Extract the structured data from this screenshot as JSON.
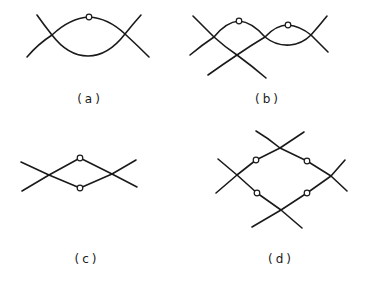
{
  "figure": {
    "stroke_color": "#1a1a1a",
    "background": "#ffffff",
    "panels": [
      {
        "id": "a",
        "label": "(a)",
        "description": "Two curves crossing twice forming a lens; one open circle at apex of upper arc",
        "crossings": 2,
        "open_circles": 1
      },
      {
        "id": "b",
        "label": "(b)",
        "description": "Three curves with three crossings; two open circles on upper arcs",
        "crossings": 4,
        "open_circles": 2
      },
      {
        "id": "c",
        "label": "(c)",
        "description": "Two straight-segment paths crossing twice forming a diamond; open circles at top and bottom vertices",
        "crossings": 2,
        "open_circles": 2
      },
      {
        "id": "d",
        "label": "(d)",
        "description": "Four crossing points arranged in a diamond; four open circles on the diamond edges",
        "crossings": 4,
        "open_circles": 4
      }
    ]
  }
}
